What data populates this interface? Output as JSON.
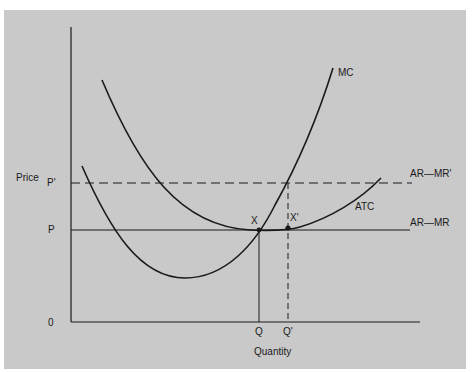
{
  "diagram": {
    "axes": {
      "y_label": "Price",
      "x_label": "Quantity",
      "origin_label": "0"
    },
    "y_ticks": [
      {
        "label": "P'",
        "y": 183
      },
      {
        "label": "P",
        "y": 230
      }
    ],
    "x_ticks": [
      {
        "label": "Q",
        "x": 259
      },
      {
        "label": "Q'",
        "x": 288
      }
    ],
    "curves": [
      {
        "name": "MC",
        "label": "MC"
      },
      {
        "name": "ATC",
        "label": "ATC"
      }
    ],
    "lines": [
      {
        "name": "demand-high",
        "label": "AR—MR'",
        "style": "dashed"
      },
      {
        "name": "demand-base",
        "label": "AR—MR",
        "style": "solid"
      }
    ],
    "points": [
      {
        "label": "X",
        "x": 259,
        "y": 230
      },
      {
        "label": "X'",
        "x": 288,
        "y": 228
      }
    ],
    "colors": {
      "background": "#c9c9c9",
      "ink": "#1a1a1a"
    }
  }
}
